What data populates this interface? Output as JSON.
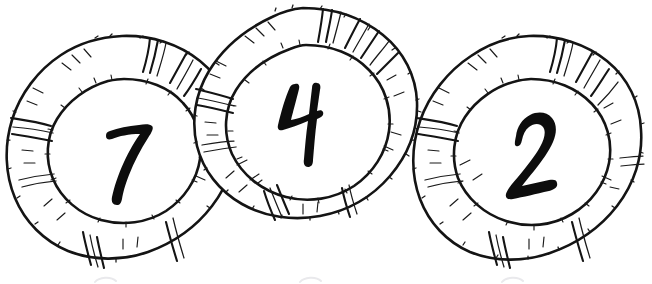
{
  "illustration": {
    "title": "Three numbered life rings",
    "style": "hand-drawn black ink line art on white",
    "background_color": "#ffffff",
    "ink_color": "#141414",
    "canvas": {
      "width": 652,
      "height": 284
    },
    "rings": [
      {
        "id": "ring-seven",
        "label": "7",
        "order": "back-left",
        "center": {
          "x": 123,
          "y": 152
        },
        "outer_radius": {
          "rx": 113,
          "ry": 116
        },
        "inner_radius": {
          "rx": 70,
          "ry": 72
        },
        "number_position": {
          "x": 131,
          "y": 160
        },
        "cropped_edges": [
          "bottom"
        ]
      },
      {
        "id": "ring-four",
        "label": "4",
        "order": "front-center",
        "center": {
          "x": 305,
          "y": 119
        },
        "outer_radius": {
          "rx": 108,
          "ry": 112
        },
        "inner_radius": {
          "rx": 70,
          "ry": 74
        },
        "number_position": {
          "x": 306,
          "y": 114
        },
        "cropped_edges": [
          "top"
        ]
      },
      {
        "id": "ring-two",
        "label": "2",
        "order": "right",
        "center": {
          "x": 530,
          "y": 152
        },
        "outer_radius": {
          "rx": 112,
          "ry": 116
        },
        "inner_radius": {
          "rx": 72,
          "ry": 74
        },
        "number_position": {
          "x": 537,
          "y": 160
        },
        "cropped_edges": [
          "bottom"
        ]
      }
    ],
    "numerals": [
      "7",
      "4",
      "2"
    ],
    "ghost_marks": {
      "description": "faint grey partial shapes clipped at the bottom edge",
      "color": "#e9e9ec",
      "positions": [
        105,
        310,
        512
      ]
    }
  }
}
